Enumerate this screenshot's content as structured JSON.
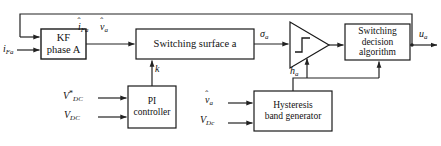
{
  "diagram": {
    "type": "control-system-block-diagram",
    "blocks": [
      {
        "id": "kf",
        "label_line1": "KF",
        "label_line2": "phase A"
      },
      {
        "id": "switching_surface",
        "label": "Switching surface a"
      },
      {
        "id": "comparator",
        "label": "hysteresis-comparator"
      },
      {
        "id": "switching_decision",
        "label_line1": "Switching",
        "label_line2": "decision",
        "label_line3": "algorithm"
      },
      {
        "id": "pi_controller",
        "label_line1": "PI",
        "label_line2": "controller"
      },
      {
        "id": "hysteresis_band",
        "label_line1": "Hysteresis",
        "label_line2": "band generator"
      }
    ],
    "signals": {
      "input_current": {
        "base": "i",
        "sub": "Fa",
        "hat": false,
        "star": false
      },
      "estimated_current": {
        "base": "i",
        "sub": "Fa",
        "hat": true,
        "star": false
      },
      "estimated_voltage": {
        "base": "v",
        "sub": "a",
        "hat": true,
        "star": false
      },
      "sigma": {
        "base": "σ",
        "sub": "a",
        "hat": false,
        "star": false
      },
      "gain_k": {
        "base": "k",
        "sub": "",
        "hat": false,
        "star": false
      },
      "hysteresis_band": {
        "base": "h",
        "sub": "a",
        "hat": false,
        "star": false
      },
      "output_u": {
        "base": "u",
        "sub": "a",
        "hat": false,
        "star": false
      },
      "vdc_reference": {
        "base": "V",
        "sub": "DC",
        "hat": false,
        "star": true
      },
      "vdc_measured": {
        "base": "V",
        "sub": "DC",
        "hat": false,
        "star": false
      },
      "vdc_band_input": {
        "base": "V",
        "sub": "Dc",
        "hat": false,
        "star": false
      },
      "vhat_band_input": {
        "base": "v",
        "sub": "a",
        "hat": true,
        "star": false
      }
    },
    "colors": {
      "line": "#222222",
      "box_border": "#1a1a1a",
      "background": "#ffffff",
      "text": "#111111"
    }
  }
}
